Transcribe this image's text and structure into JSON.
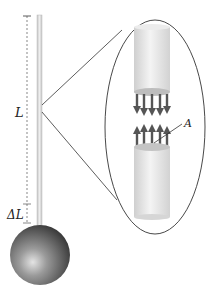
{
  "diagram": {
    "labels": {
      "length": "L",
      "elongation": "ΔL",
      "area": "A"
    },
    "colors": {
      "rod": "#d8d8d8",
      "rod_edge": "#b0b0b0",
      "arrow": "#555555",
      "outline": "#333333",
      "sphere_light": "#d8d8d8",
      "sphere_dark": "#4a4a4a"
    }
  }
}
